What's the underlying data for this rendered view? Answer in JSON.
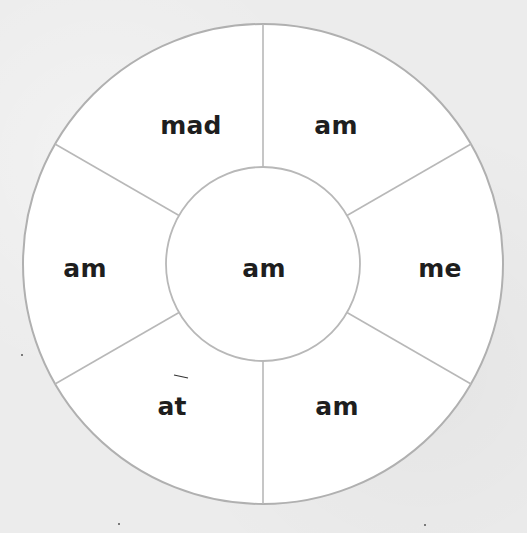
{
  "wheel": {
    "center_word": "am",
    "segments": [
      {
        "position": "top-left",
        "word": "mad"
      },
      {
        "position": "top-right",
        "word": "am"
      },
      {
        "position": "right",
        "word": "me"
      },
      {
        "position": "bottom-right",
        "word": "am"
      },
      {
        "position": "bottom-left",
        "word": "at"
      },
      {
        "position": "left",
        "word": "am"
      }
    ],
    "colors": {
      "fill": "#ffffff",
      "stroke": "#b0b0b0",
      "text": "#1e1e1e",
      "background": "#ececec"
    }
  }
}
